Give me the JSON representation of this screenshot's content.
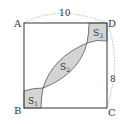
{
  "diagram": {
    "type": "geometry",
    "vertices": {
      "A": {
        "label": "A"
      },
      "B": {
        "label": "B"
      },
      "C": {
        "label": "C"
      },
      "D": {
        "label": "D"
      }
    },
    "dimensions": {
      "top": "10",
      "right": "8"
    },
    "regions": {
      "S1": {
        "label": "S",
        "sub": "1"
      },
      "S2": {
        "label": "S",
        "sub": "2"
      },
      "S3": {
        "label": "S",
        "sub": "3"
      }
    },
    "colors": {
      "stroke": "#555555",
      "fill": "#d4d4d4",
      "dotted": "#9a9a9a",
      "text": "#333333"
    }
  }
}
